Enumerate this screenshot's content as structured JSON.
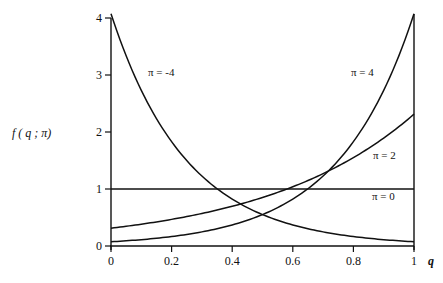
{
  "chart_data": {
    "type": "line",
    "title": "",
    "xlabel": "q",
    "ylabel": "f ( q ; π)",
    "xlim": [
      0,
      1
    ],
    "ylim": [
      0,
      4
    ],
    "grid": false,
    "legend": "inline curve labels",
    "x_ticks": [
      "0",
      "0.2",
      "0.4",
      "0.6",
      "0.8",
      "1"
    ],
    "y_ticks": [
      "0",
      "1",
      "2",
      "3",
      "4"
    ],
    "x": [
      0,
      0.1,
      0.2,
      0.3,
      0.4,
      0.5,
      0.6,
      0.7,
      0.8,
      0.9,
      1.0
    ],
    "series": [
      {
        "name": "π = -4",
        "values": [
          4.07,
          2.73,
          1.83,
          1.23,
          0.82,
          0.55,
          0.37,
          0.25,
          0.17,
          0.11,
          0.07
        ]
      },
      {
        "name": "π = 4",
        "values": [
          0.07,
          0.11,
          0.17,
          0.25,
          0.37,
          0.55,
          0.82,
          1.23,
          1.83,
          2.73,
          4.07
        ]
      },
      {
        "name": "π = 2",
        "values": [
          0.31,
          0.38,
          0.47,
          0.57,
          0.7,
          0.85,
          1.04,
          1.27,
          1.55,
          1.89,
          2.31
        ]
      },
      {
        "name": "π = 0",
        "values": [
          1,
          1,
          1,
          1,
          1,
          1,
          1,
          1,
          1,
          1,
          1
        ]
      }
    ],
    "annotations": [
      "π = -4",
      "π = 4",
      "π = 2",
      "π = 0"
    ]
  },
  "labels": {
    "ylabel": "f ( q ; π)",
    "xlabel": "q",
    "curve_neg4": "π = -4",
    "curve_4": "π = 4",
    "curve_2": "π = 2",
    "curve_0": "π = 0"
  }
}
